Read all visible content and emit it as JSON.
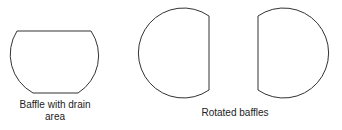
{
  "diagram": {
    "shapes": [
      {
        "name": "baffle-with-drain-area",
        "type": "circle-segment-truncated-top-bottom"
      },
      {
        "name": "rotated-baffle-left",
        "type": "circle-segment-truncated-right"
      },
      {
        "name": "rotated-baffle-right",
        "type": "circle-segment-truncated-left"
      }
    ],
    "labels": {
      "baffle_drain_line1": "Baffle with drain",
      "baffle_drain_line2": "area",
      "rotated": "Rotated baffles"
    },
    "stroke_color": "#333333"
  }
}
